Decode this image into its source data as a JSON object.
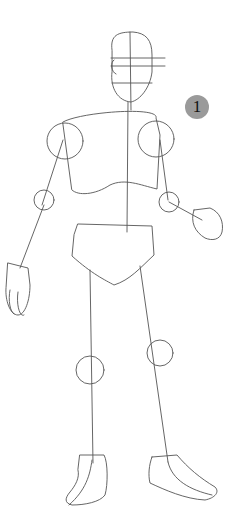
{
  "figure": {
    "step_number": "1",
    "badge_color": "#9a9a9a",
    "stroke_color": "#555555",
    "parts": [
      "head",
      "face-guidelines",
      "torso",
      "shoulder-joints",
      "elbow-joints",
      "hands",
      "pelvis",
      "knee-joints",
      "feet",
      "spine-line"
    ]
  }
}
